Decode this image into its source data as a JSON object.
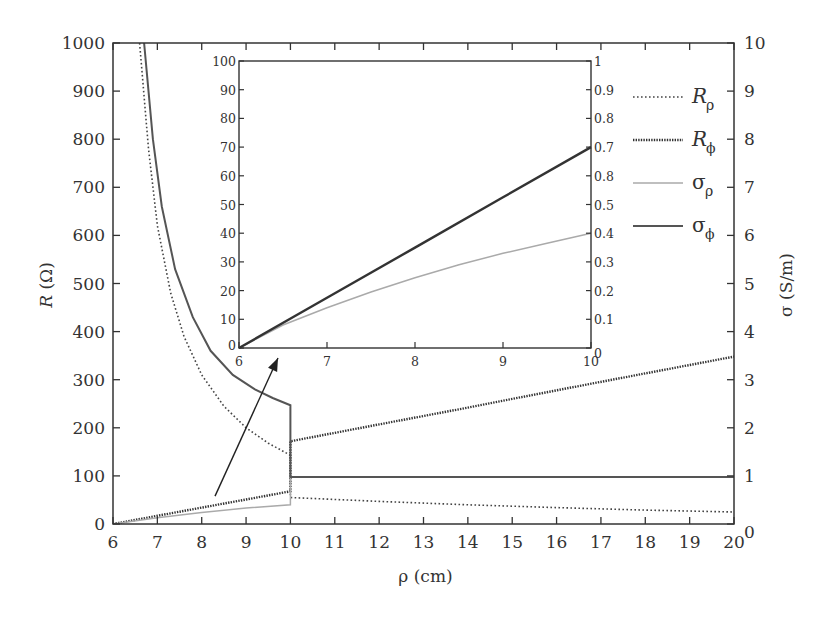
{
  "chart_data": [
    {
      "type": "line",
      "name": "main",
      "title": "",
      "xlabel": "ρ (cm)",
      "ylabel_left": "R (Ω)",
      "ylabel_right": "σ (S/m)",
      "xlim": [
        6,
        20
      ],
      "ylim_left": [
        0,
        1000
      ],
      "ylim_right": [
        0,
        10
      ],
      "x_ticks": [
        "6",
        "7",
        "8",
        "9",
        "10",
        "11",
        "12",
        "13",
        "14",
        "15",
        "16",
        "17",
        "18",
        "19",
        "20"
      ],
      "y_ticks_left": [
        "0",
        "100",
        "200",
        "300",
        "400",
        "500",
        "600",
        "700",
        "800",
        "900",
        "1000"
      ],
      "y_ticks_right": [
        "0",
        "1",
        "2",
        "3",
        "4",
        "5",
        "6",
        "7",
        "8",
        "9",
        "10"
      ],
      "grid": false,
      "legend_position": "upper right (inside)",
      "series": [
        {
          "name": "R_ρ",
          "style": "sparse-dotted",
          "color": "#444444",
          "points": [
            [
              6.6,
              1000
            ],
            [
              6.8,
              780
            ],
            [
              7.0,
              620
            ],
            [
              7.3,
              480
            ],
            [
              7.6,
              390
            ],
            [
              8.0,
              310
            ],
            [
              8.5,
              245
            ],
            [
              9.0,
              200
            ],
            [
              9.5,
              168
            ],
            [
              10.0,
              143
            ],
            [
              10.0,
              55
            ],
            [
              12,
              47
            ],
            [
              14,
              40
            ],
            [
              16,
              34
            ],
            [
              18,
              29
            ],
            [
              20,
              25
            ]
          ]
        },
        {
          "name": "R_φ",
          "style": "dense-dotted",
          "color": "#333333",
          "points": [
            [
              6,
              0
            ],
            [
              7,
              17
            ],
            [
              8,
              34
            ],
            [
              9,
              51
            ],
            [
              10,
              68
            ],
            [
              10,
              172
            ],
            [
              12,
              207
            ],
            [
              14,
              242
            ],
            [
              16,
              278
            ],
            [
              18,
              313
            ],
            [
              20,
              348
            ]
          ]
        },
        {
          "name": "σ_ρ",
          "style": "solid-light",
          "color": "#aaaaaa",
          "points": [
            [
              6,
              0
            ],
            [
              7,
              13
            ],
            [
              8,
              24
            ],
            [
              9,
              33
            ],
            [
              10,
              40
            ],
            [
              10,
              98
            ]
          ]
        },
        {
          "name": "σ_φ",
          "style": "solid",
          "color": "#555555",
          "points": [
            [
              6.7,
              1000
            ],
            [
              6.9,
              800
            ],
            [
              7.1,
              660
            ],
            [
              7.4,
              530
            ],
            [
              7.8,
              430
            ],
            [
              8.2,
              360
            ],
            [
              8.7,
              310
            ],
            [
              9.2,
              280
            ],
            [
              9.6,
              262
            ],
            [
              10.0,
              247
            ],
            [
              10.0,
              98
            ],
            [
              20,
              98
            ]
          ]
        }
      ]
    },
    {
      "type": "line",
      "name": "inset",
      "title": "",
      "xlim": [
        6,
        10
      ],
      "ylim_left": [
        0,
        100
      ],
      "ylim_right": [
        0,
        1
      ],
      "x_ticks": [
        "6",
        "7",
        "8",
        "9",
        "10"
      ],
      "y_ticks_left": [
        "0",
        "10",
        "20",
        "30",
        "40",
        "50",
        "60",
        "70",
        "80",
        "90",
        "100"
      ],
      "y_ticks_right": [
        "0",
        "0.1",
        "0.2",
        "0.3",
        "0.4",
        "0.5",
        "0.8",
        "0.7",
        "0.8",
        "0.9",
        "1"
      ],
      "grid": false,
      "series": [
        {
          "name": "σ_φ",
          "style": "solid-dark",
          "color": "#333333",
          "points": [
            [
              6,
              0
            ],
            [
              7,
              17.5
            ],
            [
              8,
              35
            ],
            [
              9,
              52.5
            ],
            [
              10,
              70
            ]
          ]
        },
        {
          "name": "σ_ρ",
          "style": "solid-light",
          "color": "#aaaaaa",
          "points": [
            [
              6,
              0
            ],
            [
              6.5,
              8
            ],
            [
              7,
              14
            ],
            [
              7.5,
              19.5
            ],
            [
              8,
              24.5
            ],
            [
              8.5,
              29
            ],
            [
              9,
              33
            ],
            [
              9.5,
              36.5
            ],
            [
              10,
              40
            ]
          ]
        }
      ]
    }
  ],
  "legend": [
    {
      "main": "R",
      "sub": "ρ",
      "style": "sparse-dotted"
    },
    {
      "main": "R",
      "sub": "ϕ",
      "style": "dense-dotted"
    },
    {
      "main": "σ",
      "sub": "ρ",
      "style": "solid-light"
    },
    {
      "main": "σ",
      "sub": "ϕ",
      "style": "solid"
    }
  ],
  "annotation": {
    "type": "arrow",
    "from": [
      8.3,
      58
    ],
    "to": [
      9.8,
      347
    ],
    "note": "points from main plot region to inset"
  }
}
